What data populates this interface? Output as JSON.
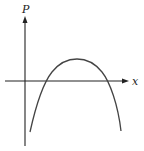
{
  "diagram": {
    "type": "function-graph",
    "y_axis_label": "P",
    "x_axis_label": "x",
    "curve": "downward parabola",
    "colors": {
      "axis": "#222222",
      "curve": "#444444",
      "background": "#ffffff"
    }
  }
}
